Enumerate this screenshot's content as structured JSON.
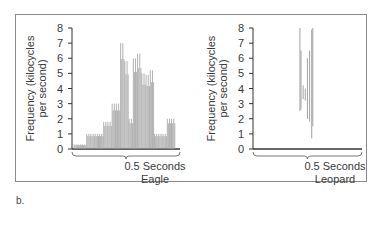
{
  "panel_label": "b.",
  "chart_data": [
    {
      "type": "area",
      "title": "Eagle",
      "xlabel": "0.5 Seconds",
      "name": "Eagle",
      "ylabel": "Frequency (kilocycles per second)",
      "ylim": [
        0,
        8
      ],
      "yticks": [
        "0",
        "1",
        "2",
        "3",
        "4",
        "5",
        "6",
        "7",
        "8"
      ],
      "grid": false,
      "x": [
        0.0,
        0.02,
        0.04,
        0.06,
        0.08,
        0.1,
        0.12,
        0.14,
        0.16,
        0.18,
        0.2,
        0.22,
        0.24,
        0.26,
        0.28,
        0.3,
        0.32,
        0.34,
        0.36,
        0.38,
        0.4,
        0.42,
        0.44,
        0.46,
        0.48,
        0.5
      ],
      "values": [
        0.3,
        0.3,
        0.3,
        1.0,
        1.0,
        1.0,
        1.0,
        1.8,
        1.8,
        3.0,
        3.0,
        7.0,
        5.8,
        2.0,
        6.0,
        6.3,
        5.0,
        4.9,
        5.2,
        1.0,
        1.0,
        1.0,
        2.0,
        2.0,
        0.0,
        0.0
      ],
      "color": "#9a9a9a"
    },
    {
      "type": "area",
      "title": "Leopard",
      "xlabel": "0.5 Seconds",
      "name": "Leopard",
      "ylabel": "Frequency (kilocycles per second)",
      "ylim": [
        0,
        8
      ],
      "yticks": [
        "0",
        "1",
        "2",
        "3",
        "4",
        "5",
        "6",
        "7",
        "8"
      ],
      "grid": false,
      "segments": [
        {
          "x": 0.21,
          "low": 2.5,
          "high": 8.0
        },
        {
          "x": 0.215,
          "low": 2.6,
          "high": 6.5
        },
        {
          "x": 0.225,
          "low": 3.3,
          "high": 4.2
        },
        {
          "x": 0.235,
          "low": 3.2,
          "high": 4.0
        },
        {
          "x": 0.245,
          "low": 2.0,
          "high": 6.0
        },
        {
          "x": 0.255,
          "low": 1.8,
          "high": 6.5
        },
        {
          "x": 0.265,
          "low": 0.7,
          "high": 7.9
        },
        {
          "x": 0.27,
          "low": 1.5,
          "high": 8.0
        }
      ],
      "color": "#9a9a9a"
    }
  ]
}
